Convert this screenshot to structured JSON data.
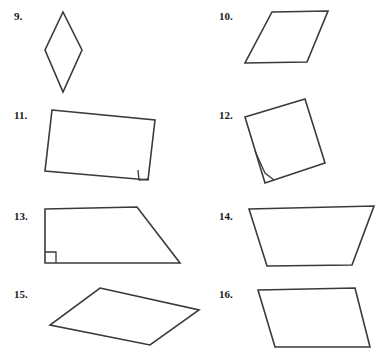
{
  "page": {
    "width": 387,
    "height": 362,
    "background_color": "#ffffff",
    "stroke_color": "#3a3a3a",
    "label_color": "#1a1a1a"
  },
  "problems": [
    {
      "id": "problem-9",
      "label": "9.",
      "label_x": 14,
      "label_y": 11,
      "shape_name": "rhombus",
      "points": "63,12 82,50 63,92 45,50",
      "right_angle": null
    },
    {
      "id": "problem-10",
      "label": "10.",
      "label_x": 219,
      "label_y": 11,
      "shape_name": "parallelogram",
      "points": "272,12 328,11 307,62 245,63",
      "right_angle": null
    },
    {
      "id": "problem-11",
      "label": "11.",
      "label_x": 14,
      "label_y": 110,
      "shape_name": "quadrilateral-with-right-angle",
      "points": "52,110 155,120 148,180 45,171",
      "right_angle": "138,170 139,180 149,179"
    },
    {
      "id": "problem-12",
      "label": "12.",
      "label_x": 219,
      "label_y": 110,
      "shape_name": "tilted-square",
      "points": "245,117 305,99 325,163 265,183",
      "right_angle": "255,151 265,173 274,180"
    },
    {
      "id": "problem-13",
      "label": "13.",
      "label_x": 14,
      "label_y": 211,
      "shape_name": "right-trapezoid",
      "points": "45,209 137,207 180,263 45,263",
      "right_angle": "45,252 56,252 56,263"
    },
    {
      "id": "problem-14",
      "label": "14.",
      "label_x": 219,
      "label_y": 211,
      "shape_name": "isosceles-trapezoid",
      "points": "249,209 374,206 352,265 267,266",
      "right_angle": null
    },
    {
      "id": "problem-15",
      "label": "15.",
      "label_x": 14,
      "label_y": 289,
      "shape_name": "parallelogram",
      "points": "100,288 199,310 150,345 50,325",
      "right_angle": null
    },
    {
      "id": "problem-16",
      "label": "16.",
      "label_x": 219,
      "label_y": 289,
      "shape_name": "parallelogram",
      "points": "258,290 355,288 370,347 275,347",
      "right_angle": null
    }
  ]
}
